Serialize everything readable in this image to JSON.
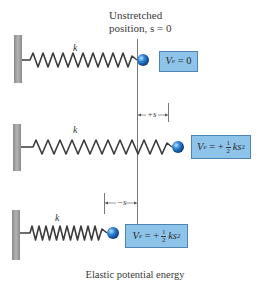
{
  "title": {
    "line1": "Unstretched",
    "line2": "position, s = 0"
  },
  "rows": [
    {
      "spring_label": "k",
      "energy": {
        "V": "V",
        "sub": "e",
        "eq": " = 0"
      },
      "state": "unstretched"
    },
    {
      "spring_label": "k",
      "dimension": "+s",
      "energy": {
        "V": "V",
        "sub": "e",
        "eq": " = +",
        "num": "1",
        "den": "2",
        "tail": "ks",
        "sup": "2"
      },
      "state": "stretched"
    },
    {
      "spring_label": "k",
      "dimension": "−s",
      "energy": {
        "V": "V",
        "sub": "e",
        "eq": " = +",
        "num": "1",
        "den": "2",
        "tail": "ks",
        "sup": "2"
      },
      "state": "compressed"
    }
  ],
  "caption": "Elastic potential energy",
  "colors": {
    "box_fill": "#8ec3ea",
    "box_border": "#4d86b5",
    "ball": "#1f6fc4",
    "wall": "#9a9a9a",
    "spring": "#3c3c3c"
  }
}
